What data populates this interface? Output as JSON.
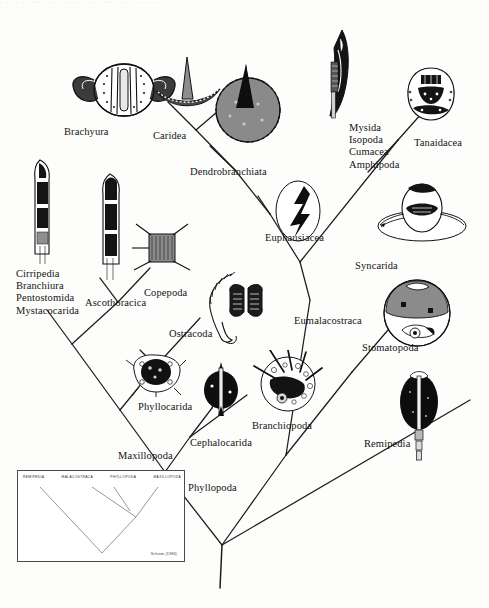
{
  "figure": {
    "kind": "phylogenetic-cladogram",
    "top_cut_text": "· ·· · ·· ··· · ·· · ···· · ·· · ··· · ·· ··· · ··",
    "ink_color": "#141414",
    "paper_color": "#fdfdfc"
  },
  "labels": {
    "brachyura": "Brachyura",
    "caridea": "Caridea",
    "dendrobranchiata": "Dendrobranchiata",
    "peracarida_group": "Mysida\nIsopoda\nCumacea\nAmphipoda",
    "tanaidacea": "Tanaidacea",
    "euphausiacea": "Euphausiacea",
    "syncarida": "Syncarida",
    "eumalacostraca": "Eumalacostraca",
    "stomatopoda": "Stomatopoda",
    "cirripedia_group": "Cirripedia\nBranchiura\nPentostomida\nMystacocarida",
    "ascothoracica": "Ascothoracica",
    "copepoda": "Copepoda",
    "ostracoda": "Ostracoda",
    "phyllocarida": "Phyllocarida",
    "cephalocarida": "Cephalocarida",
    "branchiopoda": "Branchiopoda",
    "maxillopoda": "Maxillopoda",
    "phyllopoda": "Phyllopoda",
    "remipedia": "Remipedia"
  },
  "inset": {
    "headers": [
      "REMIPEDIA",
      "MALACOSTRACA",
      "PHYLLOPODA",
      "MAXILLOPODA"
    ],
    "credit": "Schram (1986)"
  },
  "taxa": [
    {
      "name": "Brachyura",
      "rank": "terminal",
      "illustration": "crab-carapace"
    },
    {
      "name": "Caridea",
      "rank": "terminal",
      "illustration": "shrimp-rostrum"
    },
    {
      "name": "Dendrobranchiata",
      "rank": "terminal",
      "illustration": "dendrobranch-gill"
    },
    {
      "name": "Mysida",
      "rank": "terminal",
      "illustration": "mysid-appendage"
    },
    {
      "name": "Isopoda",
      "rank": "terminal",
      "illustration": "mysid-appendage"
    },
    {
      "name": "Cumacea",
      "rank": "terminal",
      "illustration": "mysid-appendage"
    },
    {
      "name": "Amphipoda",
      "rank": "terminal",
      "illustration": "mysid-appendage"
    },
    {
      "name": "Tanaidacea",
      "rank": "terminal",
      "illustration": "tanaid-section"
    },
    {
      "name": "Euphausiacea",
      "rank": "terminal",
      "illustration": "euphausiid-gill"
    },
    {
      "name": "Syncarida",
      "rank": "terminal",
      "illustration": "syncarid-section"
    },
    {
      "name": "Stomatopoda",
      "rank": "terminal",
      "illustration": "stomatopod-section"
    },
    {
      "name": "Cirripedia",
      "rank": "terminal",
      "illustration": "cirriped-limb"
    },
    {
      "name": "Branchiura",
      "rank": "terminal",
      "illustration": "cirriped-limb"
    },
    {
      "name": "Pentostomida",
      "rank": "terminal",
      "illustration": "cirriped-limb"
    },
    {
      "name": "Mystacocarida",
      "rank": "terminal",
      "illustration": "cirriped-limb"
    },
    {
      "name": "Ascothoracica",
      "rank": "terminal",
      "illustration": "ascothoracican-limb"
    },
    {
      "name": "Copepoda",
      "rank": "terminal",
      "illustration": "copepod-segment"
    },
    {
      "name": "Ostracoda",
      "rank": "terminal",
      "illustration": "ostracod-limb"
    },
    {
      "name": "Phyllocarida",
      "rank": "terminal",
      "illustration": "phyllocarid-section"
    },
    {
      "name": "Cephalocarida",
      "rank": "terminal",
      "illustration": "cephalocarid-limb"
    },
    {
      "name": "Branchiopoda",
      "rank": "terminal",
      "illustration": "branchiopod-section"
    },
    {
      "name": "Remipedia",
      "rank": "terminal",
      "illustration": "remipede-section"
    },
    {
      "name": "Eumalacostraca",
      "rank": "node"
    },
    {
      "name": "Maxillopoda",
      "rank": "node"
    },
    {
      "name": "Phyllopoda",
      "rank": "node"
    }
  ]
}
